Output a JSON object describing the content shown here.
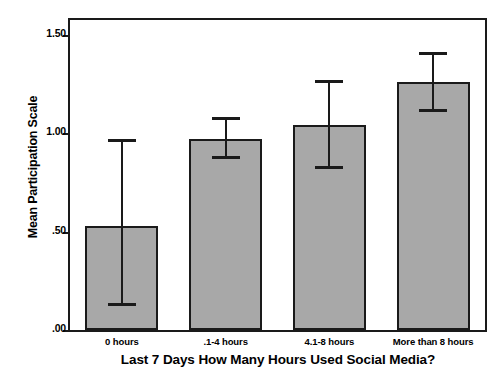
{
  "chart_data": {
    "type": "bar",
    "title": "",
    "xlabel": "Last 7 Days How Many Hours Used Social Media?",
    "ylabel": "Mean Participation Scale",
    "categories": [
      "0 hours",
      ".1-4 hours",
      "4.1-8 hours",
      "More than 8 hours"
    ],
    "values": [
      0.53,
      0.97,
      1.04,
      1.26
    ],
    "error_bars": {
      "type": "confidence-interval",
      "lower": [
        0.12,
        0.87,
        0.82,
        1.11
      ],
      "upper": [
        0.97,
        1.08,
        1.27,
        1.41
      ]
    },
    "ylim": [
      0.0,
      1.575
    ],
    "yticks": [
      0.0,
      0.5,
      1.0,
      1.5
    ],
    "ytick_labels": [
      ".00",
      ".50",
      "1.00",
      "1.50"
    ],
    "grid": false,
    "legend": false,
    "bar_color": "#a8a8a8",
    "bar_edge_color": "#1a1a1a",
    "error_bar_color": "#1a1a1a"
  },
  "axes": {
    "y_title": "Mean Participation Scale",
    "x_title": "Last 7 Days How Many Hours Used Social Media?"
  }
}
